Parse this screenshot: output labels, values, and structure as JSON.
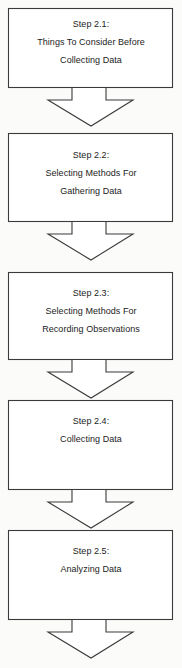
{
  "diagram": {
    "orientation": "vertical",
    "background_color": "#fbfbfa",
    "box_fill_color": "#ffffff",
    "line_color": "#3b3b3b",
    "text_color": "#1c1c1c",
    "steps": [
      {
        "id": "step-2-1",
        "heading": "Step 2.1:",
        "lines": [
          "Things To Consider Before",
          "Collecting Data"
        ]
      },
      {
        "id": "step-2-2",
        "heading": "Step 2.2:",
        "lines": [
          "Selecting Methods For",
          "Gathering Data"
        ]
      },
      {
        "id": "step-2-3",
        "heading": "Step 2.3:",
        "lines": [
          "Selecting Methods For",
          "Recording Observations"
        ]
      },
      {
        "id": "step-2-4",
        "heading": "Step 2.4:",
        "lines": [
          "Collecting Data"
        ]
      },
      {
        "id": "step-2-5",
        "heading": "Step 2.5:",
        "lines": [
          "Analyzing Data"
        ]
      }
    ],
    "connectors": [
      {
        "id": "arrow-1",
        "from": "step-2-1",
        "to": "step-2-2",
        "shape": "block-arrow-down"
      },
      {
        "id": "arrow-2",
        "from": "step-2-2",
        "to": "step-2-3",
        "shape": "block-arrow-down"
      },
      {
        "id": "arrow-3",
        "from": "step-2-3",
        "to": "step-2-4",
        "shape": "block-arrow-down"
      },
      {
        "id": "arrow-4",
        "from": "step-2-4",
        "to": "step-2-5",
        "shape": "block-arrow-down"
      },
      {
        "id": "arrow-5",
        "from": "step-2-5",
        "to": "",
        "shape": "block-arrow-down"
      }
    ]
  }
}
